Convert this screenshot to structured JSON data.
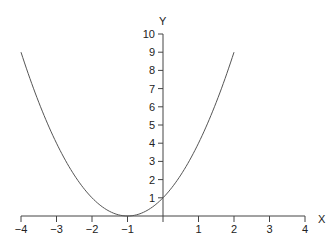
{
  "chart_data": {
    "type": "line",
    "title": "",
    "xlabel": "X",
    "ylabel": "Y",
    "xlim": [
      -4,
      4
    ],
    "ylim": [
      0,
      10
    ],
    "grid": false,
    "legend": null,
    "x_ticks": [
      -4,
      -3,
      -2,
      -1,
      1,
      2,
      3,
      4
    ],
    "x_tick_labels": [
      "−4",
      "−3",
      "−2",
      "−1",
      "1",
      "2",
      "3",
      "4"
    ],
    "y_ticks": [
      1,
      2,
      3,
      4,
      5,
      6,
      7,
      8,
      9,
      10
    ],
    "y_tick_labels": [
      "1",
      "2",
      "3",
      "4",
      "5",
      "6",
      "7",
      "8",
      "9",
      "10"
    ],
    "series": [
      {
        "name": "y = (x + 1)^2",
        "x": [
          -4,
          -3.5,
          -3,
          -2.5,
          -2,
          -1.5,
          -1,
          -0.5,
          0,
          0.5,
          1,
          1.5,
          2
        ],
        "values": [
          9,
          6.25,
          4,
          2.25,
          1,
          0.25,
          0,
          0.25,
          1,
          2.25,
          4,
          6.25,
          9
        ]
      }
    ]
  },
  "colors": {
    "axis": "#444444",
    "curve": "#555555",
    "text": "#222222"
  }
}
